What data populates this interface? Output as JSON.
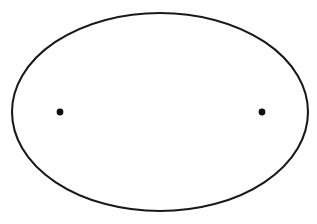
{
  "figure": {
    "type": "geometric-diagram",
    "background_color": "#ffffff",
    "width": 317,
    "height": 224
  },
  "geometry": {
    "canvas": {
      "width": 317,
      "height": 224
    },
    "ellipse": {
      "label": "ellipse-boundary",
      "center_x": 160,
      "center_y": 112,
      "semi_major_a": 148,
      "semi_minor_b": 99,
      "stroke_color": "#1a1a1a",
      "stroke_width": 2.1,
      "fill_color": "#ffffff"
    },
    "foci": [
      {
        "label": "left-focus",
        "x": 60,
        "y": 112,
        "dot_radius": 3.4,
        "dot_color": "#101010",
        "ray_count": 36,
        "ray_step_degrees": 10
      },
      {
        "label": "right-focus",
        "x": 262,
        "y": 112,
        "dot_radius": 3.4,
        "dot_color": "#101010",
        "ray_count": 36,
        "ray_step_degrees": 10
      }
    ],
    "center_vertical_line": {
      "label": "minor-axis-chord",
      "x": 161,
      "y_top": 13,
      "y_bottom": 210,
      "stroke_color": "#6e6e6e",
      "stroke_width": 1.25
    },
    "major_axis_line": {
      "label": "major-axis",
      "x_left": 12,
      "x_right": 308,
      "y": 112,
      "stroke_color": "#6e6e6e",
      "stroke_width": 1.15
    },
    "latus_rectum_lines": [
      {
        "label": "left-latus-rectum",
        "x": 60,
        "stroke_color": "#7a7a7a",
        "stroke_width": 1.5
      },
      {
        "label": "right-latus-rectum",
        "x": 262,
        "stroke_color": "#7a7a7a",
        "stroke_width": 1.5
      }
    ],
    "apex_vertices": {
      "label": "vertical-chord-endpoints",
      "top_x": 161,
      "top_y": 13,
      "bottom_x": 161,
      "bottom_y": 210
    },
    "chevron_apex_y_values": [
      61,
      88,
      112,
      136,
      163
    ],
    "ray_stroke_color": "#2b2b2b",
    "ray_stroke_width": 0.95
  },
  "chart_data": {
    "type": "scatter",
    "xlabel": "",
    "ylabel": "",
    "grid": false,
    "legend": null,
    "xlim": [
      12,
      308
    ],
    "ylim": [
      13,
      211
    ],
    "annotations": [
      "Ellipse outline: center (160, 112), a = 148, b = 99",
      "Left focus at (60, 112)",
      "Right focus at (262, 112)",
      "36 rays emanate from each focus at 10 degree increments",
      "Rays directed toward the center terminate on the vertical chord x = 161",
      "Vertical chord spans from (161, 13) to (161, 210)",
      "Horizontal major axis spans from (12, 112) to (308, 112)",
      "Vertical latus rectum chords pass through each focus",
      "Chevron apex points on the center chord at y = 61, 88, 112, 136, 163"
    ],
    "points": [
      {
        "name": "ellipse-center",
        "x": 160,
        "y": 112
      },
      {
        "name": "left-focus",
        "x": 60,
        "y": 112
      },
      {
        "name": "right-focus",
        "x": 262,
        "y": 112
      },
      {
        "name": "top-vertex",
        "x": 161,
        "y": 13
      },
      {
        "name": "bottom-vertex",
        "x": 161,
        "y": 210
      },
      {
        "name": "left-vertex",
        "x": 12,
        "y": 112
      },
      {
        "name": "right-vertex",
        "x": 308,
        "y": 112
      }
    ]
  }
}
